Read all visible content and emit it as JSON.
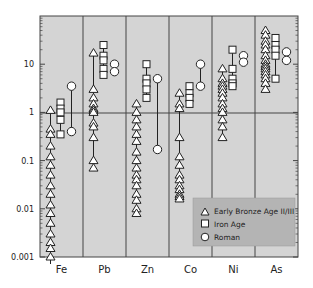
{
  "chart_data": {
    "type": "scatter",
    "title": "",
    "xlabel": "",
    "ylabel": "",
    "yscale": "log",
    "ylim": [
      0.001,
      100
    ],
    "y_ticks": [
      "0.001",
      "0.01",
      "0.1",
      "1",
      "10"
    ],
    "categories": [
      "Fe",
      "Pb",
      "Zn",
      "Co",
      "Ni",
      "As"
    ],
    "reference_line": 1,
    "grid": false,
    "legend_position": "lower right",
    "legend": [
      {
        "name": "Early Bronze Age II/III",
        "marker": "triangle"
      },
      {
        "name": "Iron Age",
        "marker": "square"
      },
      {
        "name": "Roman",
        "marker": "circle"
      }
    ],
    "series": [
      {
        "name": "Early Bronze Age II/III",
        "marker": "triangle",
        "values": {
          "Fe": [
            1.1,
            0.45,
            0.35,
            0.2,
            0.12,
            0.08,
            0.05,
            0.03,
            0.02,
            0.012,
            0.008,
            0.005,
            0.003,
            0.002,
            0.0015,
            0.001
          ],
          "Pb": [
            17,
            3,
            2,
            1.5,
            1.2,
            1.1,
            1.0,
            0.6,
            0.5,
            0.3,
            0.1,
            0.07
          ],
          "Zn": [
            1.5,
            1.0,
            0.7,
            0.5,
            0.35,
            0.25,
            0.15,
            0.1,
            0.07,
            0.05,
            0.04,
            0.03,
            0.02,
            0.015,
            0.01,
            0.008
          ],
          "Co": [
            2.5,
            1.5,
            1.2,
            0.3,
            0.12,
            0.08,
            0.05,
            0.04,
            0.03,
            0.025,
            0.02,
            0.018,
            0.016
          ],
          "Ni": [
            8,
            5,
            4,
            3.5,
            3,
            2.5,
            2,
            1.5,
            1.2,
            1,
            0.7,
            0.5,
            0.3
          ],
          "As": [
            50,
            40,
            30,
            25,
            20,
            15,
            12,
            10,
            9,
            8,
            7,
            6,
            5,
            4,
            3
          ]
        }
      },
      {
        "name": "Iron Age",
        "marker": "square",
        "values": {
          "Fe": [
            1.6,
            1.2,
            1.0,
            0.7,
            0.35
          ],
          "Pb": [
            25,
            15,
            12,
            8,
            6
          ],
          "Zn": [
            10,
            5,
            4,
            3,
            2
          ],
          "Co": [
            3.5,
            2.5,
            2,
            1.5
          ],
          "Ni": [
            20,
            8,
            5,
            4,
            3.5
          ],
          "As": [
            35,
            25,
            20,
            15,
            5
          ]
        }
      },
      {
        "name": "Roman",
        "marker": "circle",
        "values": {
          "Fe": [
            3.5,
            0.4
          ],
          "Pb": [
            10,
            7
          ],
          "Zn": [
            5,
            0.17
          ],
          "Co": [
            10,
            3.5
          ],
          "Ni": [
            15,
            11
          ],
          "As": [
            18,
            12
          ]
        }
      }
    ]
  }
}
